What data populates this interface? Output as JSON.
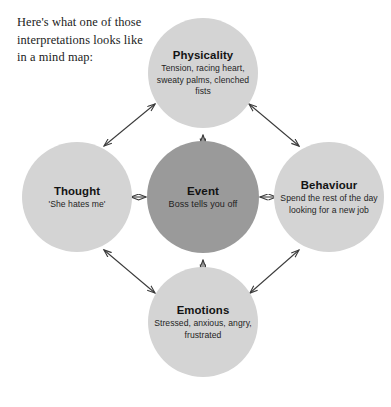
{
  "intro": {
    "lines": [
      "Here's what one of those",
      "interpretations looks like",
      "in a mind map:"
    ]
  },
  "colors": {
    "satellite_fill": "#d4d4d4",
    "center_fill": "#9a9a9a",
    "arrow_stroke": "#3a3a3a",
    "text": "#131313",
    "background": "#ffffff"
  },
  "nodes": {
    "center": {
      "id": "event",
      "title": "Event",
      "body": "Boss tells you off"
    },
    "top": {
      "id": "physicality",
      "title": "Physicality",
      "body": "Tension, racing heart, sweaty palms, clenched fists"
    },
    "left": {
      "id": "thought",
      "title": "Thought",
      "body": "'She hates me'"
    },
    "right": {
      "id": "behaviour",
      "title": "Behaviour",
      "body": "Spend the rest of the day looking for a new job"
    },
    "bottom": {
      "id": "emotions",
      "title": "Emotions",
      "body": "Stressed, anxious, angry, frustrated"
    }
  },
  "connections": [
    {
      "from": "event",
      "to": "physicality",
      "style": "double-arrow"
    },
    {
      "from": "event",
      "to": "thought",
      "style": "double-arrow"
    },
    {
      "from": "event",
      "to": "behaviour",
      "style": "double-arrow"
    },
    {
      "from": "event",
      "to": "emotions",
      "style": "double-arrow"
    },
    {
      "from": "thought",
      "to": "physicality",
      "style": "double-arrow"
    },
    {
      "from": "physicality",
      "to": "behaviour",
      "style": "double-arrow"
    },
    {
      "from": "behaviour",
      "to": "emotions",
      "style": "double-arrow"
    },
    {
      "from": "emotions",
      "to": "thought",
      "style": "double-arrow"
    }
  ]
}
